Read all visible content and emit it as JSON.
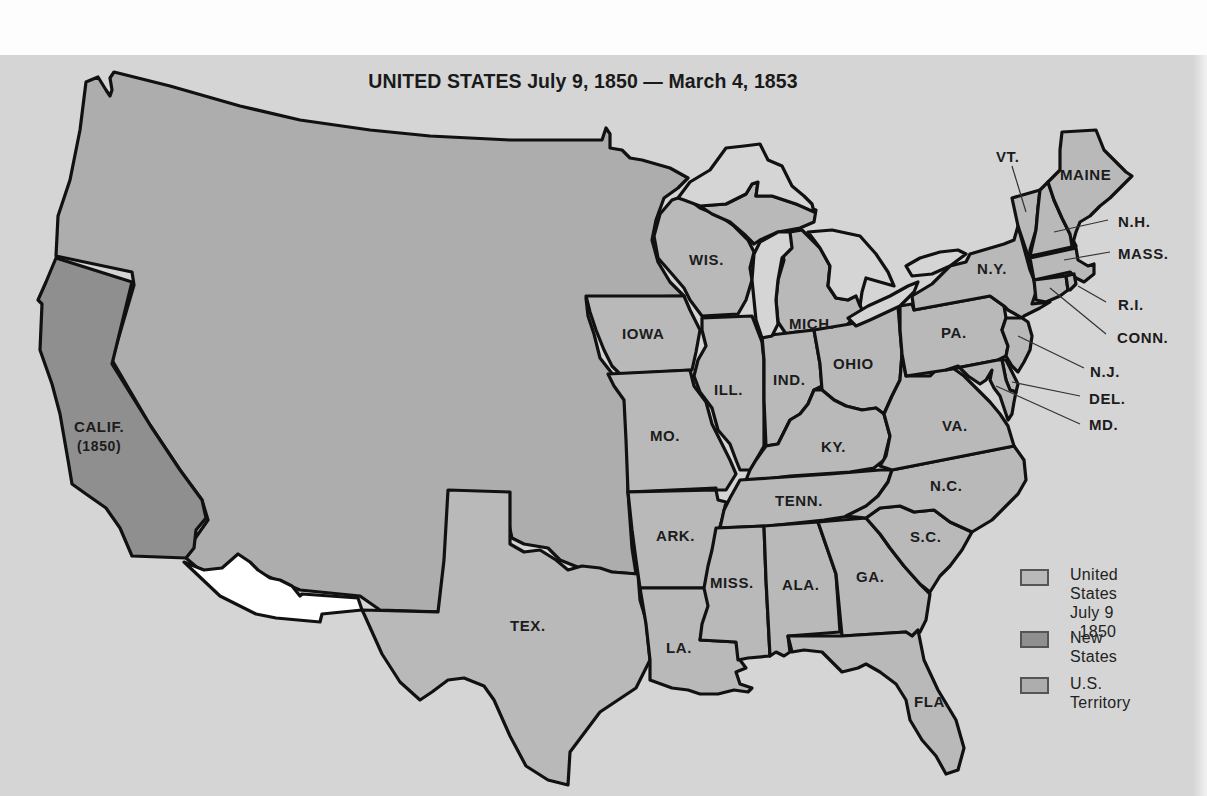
{
  "title": "UNITED STATES July  9, 1850 — March 4, 1853",
  "colors": {
    "background": "#d5d5d5",
    "states_1850": "#b9b9b9",
    "new_states": "#8f8f8f",
    "territory": "#adadad",
    "foreign": "#d5d5d5",
    "gadsden_purchase_area": "#ffffff",
    "lakes": "#d5d5d5",
    "border": "#111111"
  },
  "states": [
    {
      "label": "CALIF.",
      "sub": "(1850)",
      "category": "new_state"
    },
    {
      "label": "TEX.",
      "category": "state_1850"
    },
    {
      "label": "IOWA",
      "category": "state_1850"
    },
    {
      "label": "MO.",
      "category": "state_1850"
    },
    {
      "label": "ARK.",
      "category": "state_1850"
    },
    {
      "label": "LA.",
      "category": "state_1850"
    },
    {
      "label": "WIS.",
      "category": "state_1850"
    },
    {
      "label": "ILL.",
      "category": "state_1850"
    },
    {
      "label": "MICH.",
      "category": "state_1850"
    },
    {
      "label": "IND.",
      "category": "state_1850"
    },
    {
      "label": "OHIO",
      "category": "state_1850"
    },
    {
      "label": "KY.",
      "category": "state_1850"
    },
    {
      "label": "TENN.",
      "category": "state_1850"
    },
    {
      "label": "MISS.",
      "category": "state_1850"
    },
    {
      "label": "ALA.",
      "category": "state_1850"
    },
    {
      "label": "GA.",
      "category": "state_1850"
    },
    {
      "label": "FLA.",
      "category": "state_1850"
    },
    {
      "label": "S.C.",
      "category": "state_1850"
    },
    {
      "label": "N.C.",
      "category": "state_1850"
    },
    {
      "label": "VA.",
      "category": "state_1850"
    },
    {
      "label": "PA.",
      "category": "state_1850"
    },
    {
      "label": "N.Y.",
      "category": "state_1850"
    },
    {
      "label": "VT.",
      "category": "state_1850"
    },
    {
      "label": "MAINE",
      "category": "state_1850"
    },
    {
      "label": "N.H.",
      "category": "state_1850"
    },
    {
      "label": "MASS.",
      "category": "state_1850"
    },
    {
      "label": "R.I.",
      "category": "state_1850"
    },
    {
      "label": "CONN.",
      "category": "state_1850"
    },
    {
      "label": "N.J.",
      "category": "state_1850"
    },
    {
      "label": "DEL.",
      "category": "state_1850"
    },
    {
      "label": "MD.",
      "category": "state_1850"
    }
  ],
  "legend": {
    "items": [
      {
        "label": "United States\nJuly  9 , 1850",
        "category": "state_1850"
      },
      {
        "label": "New States",
        "category": "new_state"
      },
      {
        "label": "U.S. Territory",
        "category": "territory"
      }
    ]
  }
}
